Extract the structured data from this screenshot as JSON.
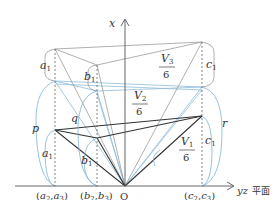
{
  "diagram": {
    "axes": {
      "vertical_label": "x",
      "horizontal_label_var": "yz",
      "horizontal_label_word": "平面",
      "origin_label": "O"
    },
    "base_labels": [
      {
        "id": "a",
        "text_open": "(",
        "v1": "a",
        "s1": "2",
        "comma": ",",
        "v2": "a",
        "s2": "3",
        "text_close": ")"
      },
      {
        "id": "b",
        "text_open": "(",
        "v1": "b",
        "s1": "2",
        "comma": ",",
        "v2": "b",
        "s2": "3",
        "text_close": ")"
      },
      {
        "id": "c",
        "text_open": "(",
        "v1": "c",
        "s1": "2",
        "comma": ",",
        "v2": "c",
        "s2": "3",
        "text_close": ")"
      }
    ],
    "segment_labels": {
      "a_top": {
        "v": "a",
        "s": "1"
      },
      "b_top": {
        "v": "b",
        "s": "1"
      },
      "c_top": {
        "v": "c",
        "s": "1"
      },
      "a_low": {
        "v": "a",
        "s": "1"
      },
      "b_low": {
        "v": "b",
        "s": "1"
      },
      "c_low": {
        "v": "c",
        "s": "1"
      },
      "p": "p",
      "q": "q",
      "r": "r"
    },
    "volume_labels": [
      {
        "id": "V3",
        "num_v": "V",
        "num_s": "3",
        "den": "6"
      },
      {
        "id": "V2",
        "num_v": "V",
        "num_s": "2",
        "den": "6"
      },
      {
        "id": "V1",
        "num_v": "V",
        "num_s": "1",
        "den": "6"
      }
    ],
    "colors": {
      "axis": "#555555",
      "gray_line": "#9a9a9a",
      "dark_line": "#333333",
      "blue_line": "#7fb2d6",
      "dash": "#666666"
    }
  }
}
